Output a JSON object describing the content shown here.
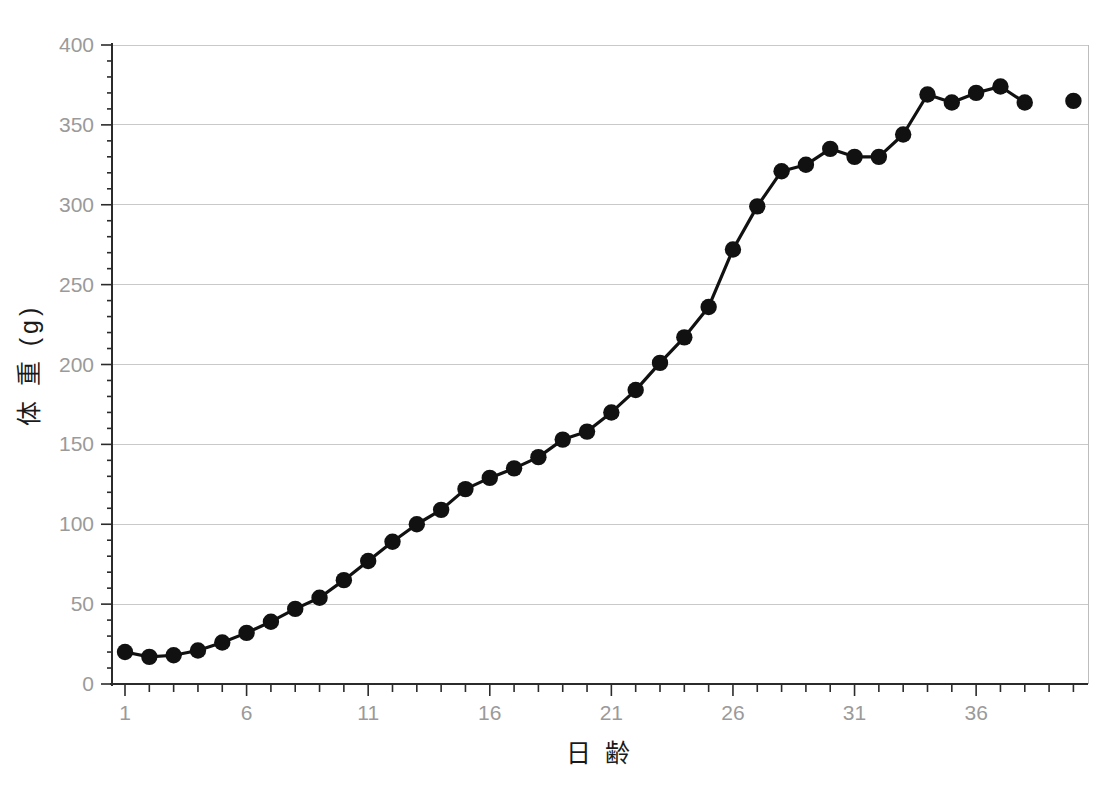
{
  "chart_data": {
    "type": "line",
    "title": "",
    "subtitle": "",
    "xlabel": "日 齢",
    "ylabel": "体 重 (g)",
    "xlim": [
      1,
      40
    ],
    "ylim": [
      0,
      400
    ],
    "ytick_labels": [
      "0",
      "50",
      "100",
      "150",
      "200",
      "250",
      "300",
      "350",
      "400"
    ],
    "ytick_values": [
      0,
      50,
      100,
      150,
      200,
      250,
      300,
      350,
      400
    ],
    "xtick_labels": [
      "1",
      "6",
      "11",
      "16",
      "21",
      "26",
      "31",
      "36"
    ],
    "xtick_values": [
      1,
      6,
      11,
      16,
      21,
      26,
      31,
      36
    ],
    "xtick_minor_step": 1,
    "grid": "horizontal",
    "legend": "none",
    "marker": "filled-circle",
    "marker_color": "#111111",
    "line_color": "#111111",
    "background_color": "#ffffff",
    "gridline_color": "#c9c9c9",
    "tick_label_color": "#9a9a9a",
    "x": [
      1,
      2,
      3,
      4,
      5,
      6,
      7,
      8,
      9,
      10,
      11,
      12,
      13,
      14,
      15,
      16,
      17,
      18,
      19,
      20,
      21,
      22,
      23,
      24,
      25,
      26,
      27,
      28,
      29,
      30,
      31,
      32,
      33,
      34,
      35,
      36,
      37,
      38,
      40
    ],
    "values": [
      20,
      17,
      18,
      21,
      26,
      32,
      39,
      47,
      54,
      65,
      77,
      89,
      100,
      109,
      122,
      129,
      135,
      142,
      153,
      158,
      170,
      184,
      201,
      217,
      236,
      272,
      299,
      321,
      325,
      335,
      330,
      330,
      344,
      369,
      364,
      370,
      374,
      364,
      365
    ],
    "series": [
      {
        "name": "体重",
        "connected_through_x": 38,
        "isolated_points": [
          {
            "x": 40,
            "y": 365
          }
        ]
      }
    ]
  },
  "axes": {
    "y_title": "体 重 (g)",
    "x_title": "日 齢"
  }
}
